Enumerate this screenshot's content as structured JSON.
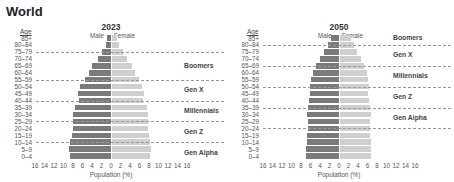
{
  "title": "World",
  "age_header": "Age",
  "male_label": "Male",
  "female_label": "Female",
  "xlabel": "Population (%)",
  "colors": {
    "male": "#7a7a7a",
    "female": "#cfcfcf",
    "dash": "#999999"
  },
  "chart_data": [
    {
      "type": "bar",
      "subtype": "population-pyramid",
      "title": "2023",
      "xlabel": "Population (%)",
      "ylabel": "Age",
      "xlim": [
        -16,
        16
      ],
      "xticks": [
        16,
        14,
        12,
        10,
        8,
        6,
        4,
        2,
        0,
        2,
        4,
        6,
        8,
        10,
        12,
        14,
        16
      ],
      "categories": [
        "85+",
        "80–84",
        "75–79",
        "70–74",
        "65–69",
        "60–64",
        "55–59",
        "50–54",
        "45–49",
        "40–44",
        "35–39",
        "30–34",
        "25–29",
        "20–24",
        "15–19",
        "10–14",
        "5–9",
        "0–4"
      ],
      "series": [
        {
          "name": "Male",
          "values": [
            0.8,
            1.0,
            1.9,
            2.8,
            3.9,
            4.7,
            5.5,
            6.5,
            6.9,
            6.8,
            7.6,
            7.9,
            7.9,
            8.0,
            8.3,
            8.7,
            8.9,
            8.6
          ]
        },
        {
          "name": "Female",
          "values": [
            1.1,
            1.5,
            2.5,
            3.3,
            4.3,
            5.0,
            5.7,
            6.5,
            6.8,
            6.7,
            7.5,
            7.7,
            7.6,
            7.6,
            7.8,
            8.1,
            8.3,
            8.1
          ]
        }
      ],
      "generation_dividers_at_rows": [
        2,
        6,
        9,
        12,
        15
      ],
      "generations": [
        {
          "label": "Boomers",
          "row": 4
        },
        {
          "label": "Gen X",
          "row": 7.5
        },
        {
          "label": "Millennials",
          "row": 10.5
        },
        {
          "label": "Gen Z",
          "row": 13.5
        },
        {
          "label": "Gen Alpha",
          "row": 16.5
        }
      ],
      "legend": [
        "Male",
        "Female"
      ],
      "grid": false
    },
    {
      "type": "bar",
      "subtype": "population-pyramid",
      "title": "2050",
      "xlabel": "Population (%)",
      "ylabel": "Age",
      "xlim": [
        -16,
        16
      ],
      "xticks": [
        16,
        14,
        12,
        10,
        8,
        6,
        4,
        2,
        0,
        2,
        4,
        6,
        8,
        10,
        12,
        14,
        16
      ],
      "categories": [
        "85+",
        "80–84",
        "75–79",
        "70–74",
        "65–69",
        "60–64",
        "55–59",
        "50–54",
        "45–49",
        "40–44",
        "35–39",
        "30–34",
        "25–29",
        "20–24",
        "15–19",
        "10–14",
        "5–9",
        "0–4"
      ],
      "series": [
        {
          "name": "Male",
          "values": [
            1.7,
            2.3,
            3.1,
            4.0,
            4.9,
            5.5,
            5.9,
            6.1,
            6.2,
            6.3,
            6.6,
            6.8,
            6.6,
            6.6,
            6.7,
            6.8,
            6.9,
            6.9
          ]
        },
        {
          "name": "Female",
          "values": [
            2.4,
            3.0,
            3.7,
            4.5,
            5.2,
            5.8,
            6.0,
            6.2,
            6.1,
            6.3,
            6.5,
            6.7,
            6.5,
            6.4,
            6.4,
            6.6,
            6.6,
            6.6
          ]
        }
      ],
      "generation_dividers_at_rows": [
        1,
        4,
        7,
        10,
        13
      ],
      "generations": [
        {
          "label": "Boomers",
          "row": 0
        },
        {
          "label": "Gen X",
          "row": 2.5
        },
        {
          "label": "Millennials",
          "row": 5.5
        },
        {
          "label": "Gen Z",
          "row": 8.5
        },
        {
          "label": "Gen Alpha",
          "row": 11.5
        }
      ],
      "legend": [
        "Male",
        "Female"
      ],
      "grid": false
    }
  ]
}
